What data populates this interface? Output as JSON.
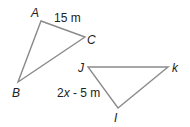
{
  "diagram": {
    "triangle_abc": {
      "vertices": {
        "A": {
          "label": "A",
          "x": 41,
          "y": 21
        },
        "B": {
          "label": "B",
          "x": 18,
          "y": 82
        },
        "C": {
          "label": "C",
          "x": 85,
          "y": 37
        }
      },
      "side_label": "15 m"
    },
    "triangle_jki": {
      "vertices": {
        "J": {
          "label": "J",
          "x": 88,
          "y": 67
        },
        "K": {
          "label": "k",
          "x": 168,
          "y": 67
        },
        "I": {
          "label": "I",
          "x": 118,
          "y": 108
        }
      },
      "side_label_prefix": "2",
      "side_label_var": "x",
      "side_label_suffix": " - 5 m"
    },
    "stroke_color": "#8a8a8a",
    "text_color": "#222222"
  }
}
